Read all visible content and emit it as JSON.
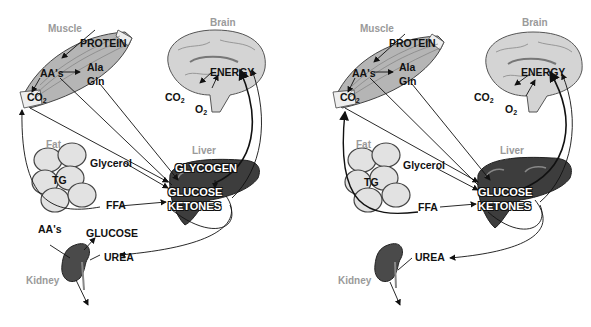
{
  "diagram": {
    "type": "metabolic-fuel-flow-comparison",
    "panels": [
      {
        "id": "left",
        "organs": {
          "muscle": "Muscle",
          "brain": "Brain",
          "fat": "Fat",
          "liver": "Liver",
          "kidney": "Kidney"
        },
        "labels": {
          "protein": "PROTEIN",
          "aas_muscle": "AA's",
          "ala": "Ala",
          "gln": "Gln",
          "co2_muscle": "CO",
          "co2_muscle_sub": "2",
          "energy": "ENERGY",
          "co2_brain": "CO",
          "co2_brain_sub": "2",
          "o2_brain": "O",
          "o2_brain_sub": "2",
          "glycerol": "Glycerol",
          "tg": "TG",
          "ffa": "FFA",
          "glycogen": "GLYCOGEN",
          "glucose_liver": "GLUCOSE",
          "ketones": "KETONES",
          "aas_kidney": "AA's",
          "glucose_kidney": "GLUCOSE",
          "urea": "UREA"
        }
      },
      {
        "id": "right",
        "organs": {
          "muscle": "Muscle",
          "brain": "Brain",
          "fat": "Fat",
          "liver": "Liver",
          "kidney": "Kidney"
        },
        "labels": {
          "protein": "PROTEIN",
          "aas_muscle": "AA's",
          "ala": "Ala",
          "gln": "Gln",
          "co2_muscle": "CO",
          "co2_muscle_sub": "2",
          "energy": "ENERGY",
          "co2_brain": "CO",
          "co2_brain_sub": "2",
          "o2_brain": "O",
          "o2_brain_sub": "2",
          "glycerol": "Glycerol",
          "tg": "TG",
          "ffa": "FFA",
          "glucose_liver": "GLUCOSE",
          "ketones": "KETONES",
          "urea": "UREA"
        }
      }
    ],
    "colors": {
      "organ_label": "#9a9a9a",
      "muscle_fill": "#b5b5b5",
      "brain_fill": "#d4d4d4",
      "fat_fill": "#e2e2e2",
      "liver_fill": "#3d3d3d",
      "kidney_fill": "#4a4a4a",
      "arrow": "#111111"
    }
  }
}
